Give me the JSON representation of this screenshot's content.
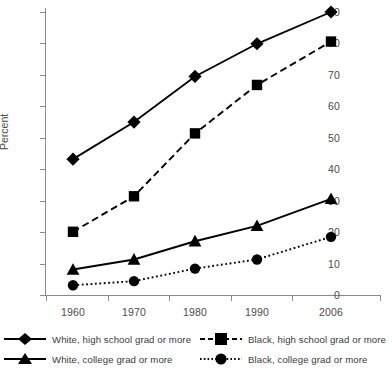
{
  "chart_data": {
    "type": "line",
    "title": "",
    "xlabel": "",
    "ylabel": "Percent",
    "categories": [
      "1960",
      "1970",
      "1980",
      "1990",
      "2006"
    ],
    "ylim": [
      0,
      90
    ],
    "yticks": [
      0,
      10,
      20,
      30,
      40,
      50,
      60,
      70,
      80,
      90
    ],
    "grid": false,
    "legend_position": "bottom",
    "series": [
      {
        "name": "White, high school grad or more",
        "marker": "diamond",
        "linestyle": "solid",
        "color": "#000000",
        "values": [
          43.2,
          55.0,
          69.5,
          79.9,
          90.0
        ]
      },
      {
        "name": "Black, high school grad or more",
        "marker": "square",
        "linestyle": "dashed",
        "color": "#000000",
        "values": [
          20.1,
          31.4,
          51.4,
          66.8,
          80.6
        ]
      },
      {
        "name": "White, college grad or more",
        "marker": "triangle",
        "linestyle": "solid",
        "color": "#000000",
        "values": [
          8.1,
          11.3,
          17.1,
          22.0,
          30.6
        ]
      },
      {
        "name": "Black, college grad or more",
        "marker": "circle",
        "linestyle": "dotted",
        "color": "#000000",
        "values": [
          3.1,
          4.4,
          8.4,
          11.3,
          18.5
        ]
      }
    ]
  },
  "axis": {
    "y_label": "Percent",
    "y_tick_labels": [
      "0",
      "10",
      "20",
      "30",
      "40",
      "50",
      "60",
      "70",
      "80",
      "90"
    ],
    "x_tick_labels": [
      "1960",
      "1970",
      "1980",
      "1990",
      "2006"
    ]
  },
  "legend": {
    "items": [
      {
        "label": "White, high school grad or more",
        "marker": "diamond",
        "linestyle": "solid"
      },
      {
        "label": "White, college grad or more",
        "marker": "triangle",
        "linestyle": "solid"
      },
      {
        "label": "Black, high school grad or more",
        "marker": "square",
        "linestyle": "dashed"
      },
      {
        "label": "Black, college grad or more",
        "marker": "circle",
        "linestyle": "dotted"
      }
    ]
  }
}
